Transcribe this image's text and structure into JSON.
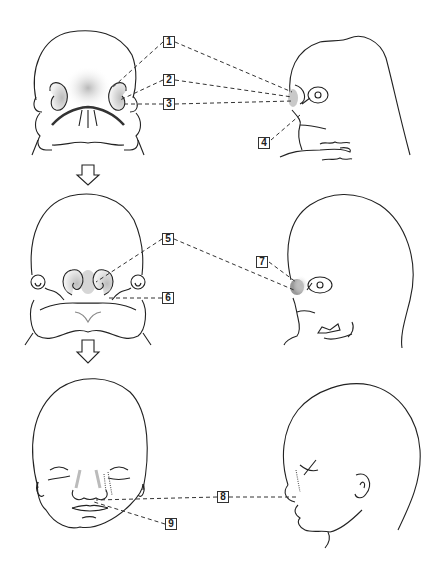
{
  "figure": {
    "stages": [
      {
        "name": "stage-1",
        "views": [
          "frontal",
          "lateral"
        ],
        "labels": [
          "1",
          "2",
          "3",
          "4"
        ]
      },
      {
        "name": "stage-2",
        "views": [
          "frontal",
          "lateral"
        ],
        "labels": [
          "5",
          "6",
          "7"
        ]
      },
      {
        "name": "stage-3",
        "views": [
          "frontal",
          "lateral"
        ],
        "labels": [
          "8",
          "9"
        ]
      }
    ],
    "arrows": [
      "down-arrow",
      "down-arrow"
    ]
  },
  "labels": {
    "l1": "1",
    "l2": "2",
    "l3": "3",
    "l4": "4",
    "l5": "5",
    "l6": "6",
    "l7": "7",
    "l8": "8",
    "l9": "9"
  },
  "colors": {
    "line": "#222222",
    "shading": "#bdbdbd",
    "background": "#ffffff"
  }
}
